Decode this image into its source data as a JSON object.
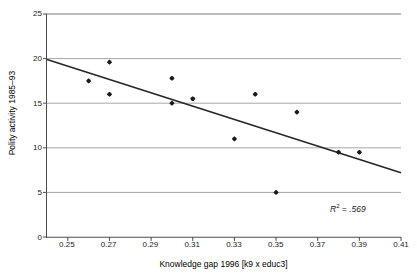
{
  "chart_data": {
    "type": "scatter",
    "title": "",
    "xlabel": "Knowledge gap 1996 [k9 x educ3]",
    "ylabel": "Polity activity 1985–93",
    "xlim": [
      0.24,
      0.41
    ],
    "ylim": [
      0,
      25
    ],
    "xticks": [
      0.25,
      0.27,
      0.29,
      0.31,
      0.33,
      0.35,
      0.37,
      0.39,
      0.41
    ],
    "xtick_labels": [
      "0.25",
      "0.27",
      "0.29",
      "0.31",
      "0.33",
      "0.35",
      "0.37",
      "0.39",
      "0.41"
    ],
    "yticks": [
      0,
      5,
      10,
      15,
      20,
      25
    ],
    "ytick_labels": [
      "0",
      "5",
      "10",
      "15",
      "20",
      "25"
    ],
    "grid": "horizontal",
    "legend": "none",
    "points": [
      {
        "x": 0.26,
        "y": 17.5
      },
      {
        "x": 0.27,
        "y": 19.6
      },
      {
        "x": 0.27,
        "y": 16.0
      },
      {
        "x": 0.3,
        "y": 17.8
      },
      {
        "x": 0.3,
        "y": 15.0
      },
      {
        "x": 0.31,
        "y": 15.5
      },
      {
        "x": 0.33,
        "y": 11.0
      },
      {
        "x": 0.34,
        "y": 16.0
      },
      {
        "x": 0.35,
        "y": 5.0
      },
      {
        "x": 0.36,
        "y": 14.0
      },
      {
        "x": 0.38,
        "y": 9.5
      },
      {
        "x": 0.39,
        "y": 9.5
      }
    ],
    "trendline": {
      "type": "linear",
      "x_start": 0.24,
      "y_start": 19.9,
      "x_end": 0.41,
      "y_end": 7.2
    },
    "annotations": [
      {
        "name": "r-squared",
        "prefix": "R",
        "superscript": "2",
        "suffix": " = .569",
        "text": "R2 = .569"
      }
    ],
    "colors": {
      "marker": "#1a1a1a",
      "trendline": "#262626",
      "gridline": "#a6a6a6",
      "axis": "#4d4d4d",
      "background": "#ffffff",
      "text": "#000000"
    }
  }
}
